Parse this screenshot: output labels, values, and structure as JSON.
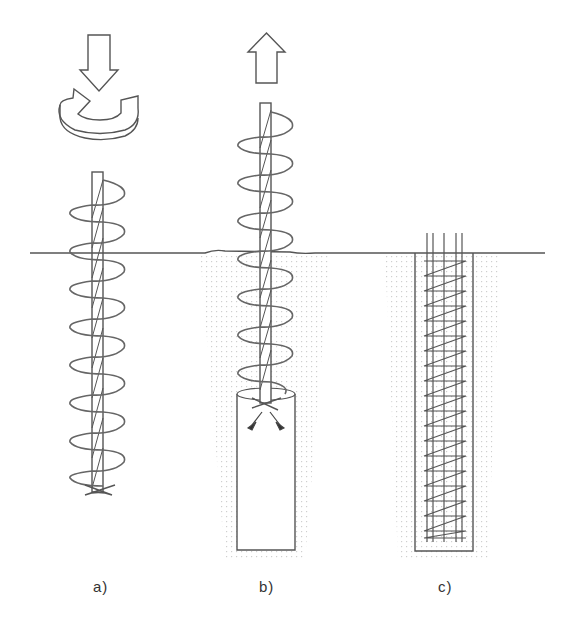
{
  "diagram": {
    "stages": [
      {
        "id": "a",
        "label": "a)",
        "action": "Auger rotated and drilled into ground"
      },
      {
        "id": "b",
        "label": "b)",
        "action": "Auger withdrawn while concrete pumped through hollow stem"
      },
      {
        "id": "c",
        "label": "c)",
        "action": "Reinforcement cage inserted into fresh concrete"
      }
    ],
    "colors": {
      "line": "#555555",
      "soil_dots": "#c8c8c8",
      "background": "#ffffff"
    },
    "icons": {
      "stage_a_top": [
        "down-arrow-icon",
        "rotation-arrow-icon"
      ],
      "stage_b_top": [
        "up-arrow-icon"
      ]
    }
  }
}
